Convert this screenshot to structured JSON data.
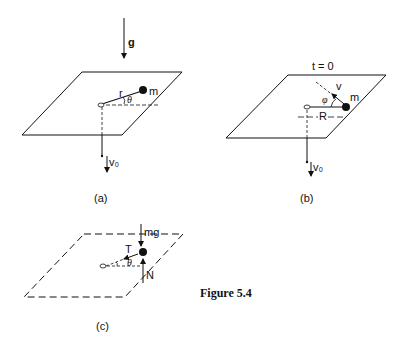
{
  "figure_caption": "Figure 5.4",
  "panels": {
    "a": {
      "caption": "(a)",
      "labels": {
        "gravity": "g",
        "radius": "r",
        "angle": "θ",
        "mass": "m",
        "velocity": "v₀"
      }
    },
    "b": {
      "caption": "(b)",
      "labels": {
        "time": "t = 0",
        "velocity": "v",
        "angle": "φ",
        "mass": "m",
        "radius": "R",
        "pull_velocity": "v₀"
      }
    },
    "c": {
      "caption": "(c)",
      "labels": {
        "weight": "mg",
        "tension": "T",
        "angle": "θ",
        "normal": "N"
      }
    }
  },
  "colors": {
    "ink": "#111111",
    "background": "#ffffff"
  }
}
